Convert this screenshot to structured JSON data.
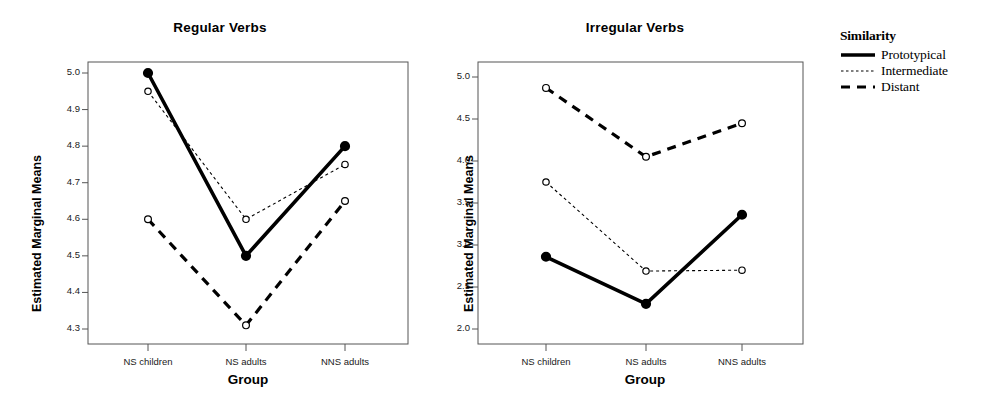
{
  "legend": {
    "title": "Similarity",
    "entries": [
      {
        "label": "Prototypical",
        "style": "solid"
      },
      {
        "label": "Intermediate",
        "style": "dotted"
      },
      {
        "label": "Distant",
        "style": "dashed"
      }
    ]
  },
  "chart_data": [
    {
      "type": "line",
      "title": "Regular Verbs",
      "xlabel": "Group",
      "ylabel": "Estimated Marginal Means",
      "categories": [
        "NS children",
        "NS adults",
        "NNS adults"
      ],
      "ylim": [
        4.25,
        5.04
      ],
      "yticks": [
        "4.3",
        "4.4",
        "4.5",
        "4.6",
        "4.7",
        "4.8",
        "4.9",
        "5.0"
      ],
      "ytick_values": [
        4.3,
        4.4,
        4.5,
        4.6,
        4.7,
        4.8,
        4.9,
        5.0
      ],
      "grid": false,
      "legend_position": "right",
      "series": [
        {
          "name": "Prototypical",
          "style": "solid",
          "values": [
            5.0,
            4.5,
            4.8
          ]
        },
        {
          "name": "Intermediate",
          "style": "dotted",
          "values": [
            4.95,
            4.6,
            4.75
          ]
        },
        {
          "name": "Distant",
          "style": "dashed",
          "values": [
            4.6,
            4.31,
            4.65
          ]
        }
      ]
    },
    {
      "type": "line",
      "title": "Irregular Verbs",
      "xlabel": "Group",
      "ylabel": "Estimated Marginal Means",
      "categories": [
        "NS children",
        "NS adults",
        "NNS adults"
      ],
      "ylim": [
        1.85,
        5.15
      ],
      "yticks": [
        "2.0",
        "2.5",
        "3.0",
        "3.5",
        "4.0",
        "4.5",
        "5.0"
      ],
      "ytick_values": [
        2.0,
        2.5,
        3.0,
        3.5,
        4.0,
        4.5,
        5.0
      ],
      "grid": false,
      "legend_position": "right",
      "series": [
        {
          "name": "Prototypical",
          "style": "solid",
          "values": [
            2.86,
            2.3,
            3.36
          ]
        },
        {
          "name": "Intermediate",
          "style": "dotted",
          "values": [
            3.75,
            2.69,
            2.7
          ]
        },
        {
          "name": "Distant",
          "style": "dashed",
          "values": [
            4.87,
            4.05,
            4.45
          ]
        }
      ]
    }
  ]
}
